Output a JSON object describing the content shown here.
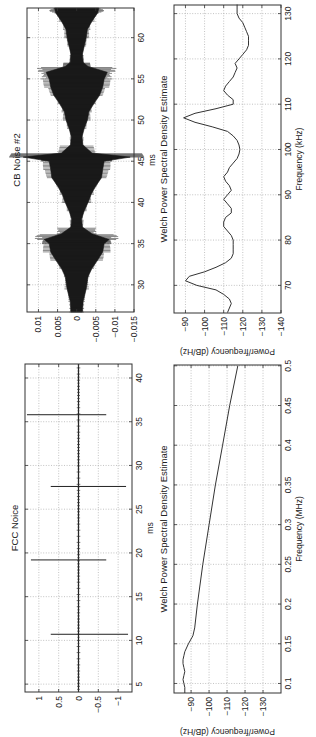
{
  "figure": {
    "orientation": "rotated 90 degrees counter-clockwise",
    "panels": [
      {
        "id": "cb_time",
        "title": "CB Noise #2",
        "xlabel": "ms",
        "ylabel": ""
      },
      {
        "id": "cb_psd",
        "title": "Welch Power Spectral Density Estimate",
        "xlabel": "Frequency (kHz)",
        "ylabel": "Power/frequency (dB/Hz)"
      },
      {
        "id": "fcc_time",
        "title": "FCC Noice",
        "xlabel": "ms",
        "ylabel": ""
      },
      {
        "id": "fcc_psd",
        "title": "Welch Power Spectral Density Estimate",
        "xlabel": "Frequency (MHz)",
        "ylabel": "Power/frequency (dB/Hz)"
      }
    ]
  },
  "chart_data": [
    {
      "type": "line",
      "title": "CB Noise #2",
      "xlabel": "ms",
      "ylabel": "",
      "xlim": [
        26.7,
        63.6
      ],
      "ylim": [
        -0.015,
        0.013
      ],
      "xticks": [
        30,
        35,
        40,
        45,
        50,
        55,
        60
      ],
      "yticks": [
        0.01,
        0.005,
        0,
        -0.005,
        -0.01,
        -0.015
      ],
      "ytick_labels": [
        "0.01",
        "0.005",
        "0",
        "−0.005",
        "−0.01",
        "−0.015"
      ],
      "grid": true,
      "envelope": {
        "x": [
          26.7,
          28,
          29.5,
          31,
          32,
          33,
          34,
          35,
          35.5,
          36.2,
          37,
          38,
          39,
          40,
          41,
          42,
          43,
          44,
          45,
          45.5,
          46,
          47,
          48,
          49,
          50,
          51,
          52,
          53,
          54,
          55,
          55.8,
          56.5,
          57,
          58,
          59,
          60,
          61,
          62,
          63,
          63.6
        ],
        "amplitude": [
          0.0015,
          0.0017,
          0.0025,
          0.003,
          0.004,
          0.0055,
          0.0068,
          0.0072,
          0.0085,
          0.004,
          0.0015,
          0.0013,
          0.002,
          0.003,
          0.0038,
          0.005,
          0.0065,
          0.0068,
          0.0072,
          0.014,
          0.004,
          0.0016,
          0.0014,
          0.002,
          0.0028,
          0.0032,
          0.0045,
          0.006,
          0.0068,
          0.0072,
          0.008,
          0.003,
          0.0017,
          0.0015,
          0.002,
          0.0025,
          0.0028,
          0.004,
          0.0055,
          0.0058
        ]
      }
    },
    {
      "type": "line",
      "title": "Welch Power Spectral Density Estimate",
      "xlabel": "Frequency (kHz)",
      "ylabel": "Power/frequency (dB/Hz)",
      "xlim": [
        63.9,
        131.9
      ],
      "ylim": [
        -140,
        -84
      ],
      "xticks": [
        70,
        80,
        90,
        100,
        110,
        120,
        130
      ],
      "yticks": [
        -90,
        -100,
        -110,
        -120,
        -130,
        -140
      ],
      "grid": true,
      "series": [
        {
          "name": "PSD",
          "x": [
            64,
            65,
            66,
            67,
            68,
            69,
            70,
            71,
            72,
            73,
            74,
            75,
            76,
            77,
            78,
            79,
            80,
            81,
            82,
            83,
            84,
            85,
            86,
            87,
            88,
            89,
            90,
            91,
            92,
            93,
            94,
            95,
            96,
            97,
            98,
            99,
            100,
            101,
            102,
            103,
            104,
            105,
            106,
            107,
            108,
            109,
            110,
            111,
            112,
            113,
            114,
            115,
            116,
            117,
            118,
            119,
            120,
            121,
            122,
            123,
            124,
            125,
            126,
            127,
            128,
            129,
            130,
            131,
            132
          ],
          "y": [
            -112,
            -113,
            -114,
            -113,
            -110,
            -106,
            -96,
            -90,
            -92,
            -100,
            -106,
            -111,
            -114,
            -115,
            -115,
            -115,
            -115,
            -114,
            -112,
            -110,
            -110,
            -111,
            -114,
            -114,
            -112,
            -110,
            -112,
            -114,
            -113,
            -111,
            -110,
            -112,
            -113,
            -115,
            -117,
            -118,
            -118.5,
            -118,
            -117,
            -115,
            -112,
            -104,
            -95,
            -89,
            -95,
            -106,
            -115,
            -115,
            -112,
            -110,
            -111,
            -113,
            -115,
            -116,
            -117,
            -116,
            -118,
            -120,
            -122,
            -123,
            -123,
            -123,
            -122,
            -121,
            -120,
            -118,
            -117,
            -117,
            -117
          ]
        }
      ]
    },
    {
      "type": "line",
      "title": "FCC Noice",
      "xlabel": "ms",
      "ylabel": "",
      "xlim": [
        4.1,
        41.6
      ],
      "ylim": [
        -1.35,
        1.35
      ],
      "xticks": [
        5,
        10,
        15,
        20,
        25,
        30,
        35,
        40
      ],
      "yticks": [
        1,
        0.5,
        0,
        -0.5,
        -1
      ],
      "ytick_labels": [
        "1",
        "0.5",
        "0",
        "−0.5",
        "−1"
      ],
      "grid": true,
      "impulses": [
        {
          "x": 10.7,
          "ymin": -1.25,
          "ymax": 0.7
        },
        {
          "x": 19.2,
          "ymin": -0.7,
          "ymax": 1.2
        },
        {
          "x": 27.6,
          "ymin": -1.2,
          "ymax": 0.7
        },
        {
          "x": 35.8,
          "ymin": -0.7,
          "ymax": 1.3
        }
      ],
      "baseline_noise_amplitude": 0.03
    },
    {
      "type": "line",
      "title": "Welch Power Spectral Density Estimate",
      "xlabel": "Frequency (MHz)",
      "ylabel": "Power/frequency (dB/Hz)",
      "xlim": [
        0.088,
        0.501
      ],
      "ylim": [
        -140,
        -80.5
      ],
      "xticks": [
        0.1,
        0.15,
        0.2,
        0.25,
        0.3,
        0.35,
        0.4,
        0.45,
        0.5
      ],
      "yticks": [
        -90,
        -100,
        -110,
        -120,
        -130
      ],
      "grid": true,
      "series": [
        {
          "name": "PSD",
          "x": [
            0.088,
            0.095,
            0.1,
            0.105,
            0.11,
            0.115,
            0.12,
            0.125,
            0.13,
            0.135,
            0.14,
            0.15,
            0.16,
            0.17,
            0.2,
            0.25,
            0.3,
            0.35,
            0.4,
            0.45,
            0.5
          ],
          "y": [
            -86.5,
            -86.5,
            -86,
            -85.5,
            -86,
            -86.5,
            -86,
            -85.5,
            -85.5,
            -86,
            -86.5,
            -88.5,
            -91,
            -92,
            -93.5,
            -96.5,
            -100,
            -103.5,
            -107.5,
            -111.5,
            -116
          ]
        }
      ]
    }
  ]
}
